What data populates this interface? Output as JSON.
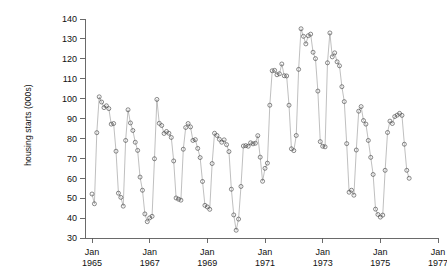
{
  "chart_data": {
    "type": "line",
    "title": "",
    "xlabel": "",
    "ylabel": "housing starts (000s)",
    "ylim": [
      30,
      140
    ],
    "yticks": [
      30,
      40,
      50,
      60,
      70,
      80,
      90,
      100,
      110,
      120,
      130,
      140
    ],
    "ytick_labels": [
      "30",
      "40",
      "50",
      "60",
      "70",
      "80",
      "90",
      "100",
      "110",
      "120",
      "130",
      "140"
    ],
    "xlim": [
      "Jan 1965",
      "Jan 1977"
    ],
    "xticks": [
      "Jan 1965",
      "Jan 1967",
      "Jan 1969",
      "Jan 1971",
      "Jan 1973",
      "Jan 1975",
      "Jan 1977"
    ],
    "xtick_labels_line1": [
      "Jan",
      "Jan",
      "Jan",
      "Jan",
      "Jan",
      "Jan",
      "Jan"
    ],
    "xtick_labels_line2": [
      "1965",
      "1967",
      "1969",
      "1971",
      "1973",
      "1975",
      "1977"
    ],
    "grid": false,
    "legend": false,
    "marker": "open-circle",
    "line_color": "#8a8a8a",
    "marker_color": "#4a4a4a",
    "x_start_year": 1965,
    "x_start_month": 1,
    "frequency": "monthly",
    "series": [
      {
        "name": "housing starts",
        "units": "thousands",
        "values": [
          52.1,
          47.2,
          82.9,
          100.9,
          98.3,
          95.5,
          96.4,
          95.0,
          87.2,
          87.5,
          73.6,
          52.5,
          50.4,
          46.0,
          79.0,
          94.4,
          87.8,
          84.0,
          78.1,
          74.0,
          60.6,
          54.0,
          42.1,
          38.2,
          40.1,
          40.9,
          69.8,
          99.6,
          87.6,
          86.5,
          82.5,
          83.5,
          82.6,
          80.5,
          68.7,
          50.1,
          49.5,
          49.0,
          74.6,
          85.5,
          87.5,
          85.8,
          79.0,
          79.4,
          75.0,
          70.4,
          58.4,
          46.4,
          45.6,
          44.4,
          67.4,
          82.6,
          81.5,
          79.6,
          78.1,
          79.3,
          76.9,
          73.4,
          54.5,
          41.6,
          33.9,
          39.5,
          55.9,
          76.2,
          76.4,
          76.1,
          77.8,
          77.3,
          77.6,
          81.4,
          70.6,
          58.5,
          65.0,
          67.6,
          96.7,
          114.0,
          114.2,
          112.0,
          112.5,
          117.4,
          111.5,
          111.4,
          96.7,
          74.8,
          73.9,
          81.5,
          114.7,
          135.1,
          131.3,
          127.5,
          131.6,
          132.4,
          123.3,
          120.1,
          103.8,
          78.4,
          76.1,
          75.8,
          118.0,
          133.0,
          121.0,
          123.0,
          118.5,
          116.5,
          106.0,
          98.5,
          77.4,
          53.0,
          54.0,
          51.5,
          74.2,
          93.7,
          96.0,
          89.0,
          87.2,
          79.0,
          70.5,
          61.9,
          44.5,
          41.8,
          40.5,
          41.5,
          64.0,
          83.0,
          88.7,
          87.5,
          91.0,
          91.7,
          92.6,
          91.6,
          77.1,
          64.0,
          60.0
        ]
      }
    ],
    "annotations": []
  },
  "axis": {
    "y_label": "housing starts (000s)"
  }
}
